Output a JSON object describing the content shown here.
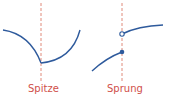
{
  "diagram": {
    "panels": [
      {
        "label": "Spitze",
        "kind": "cusp"
      },
      {
        "label": "Sprung",
        "kind": "jump"
      }
    ],
    "colors": {
      "curve": "#2e5a9c",
      "guide": "#e08a7a",
      "label": "#d0504a"
    }
  }
}
